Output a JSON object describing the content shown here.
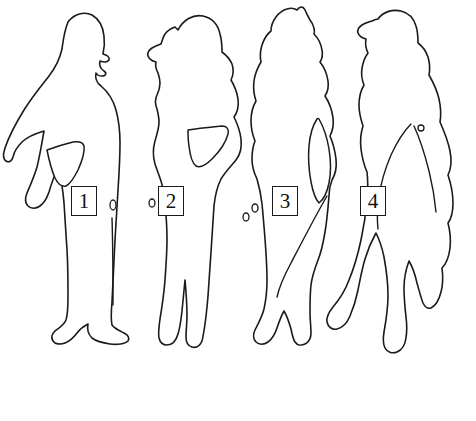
{
  "image": {
    "title": "Four human figure outlines",
    "width": 476,
    "height": 421,
    "background_color": "#ffffff",
    "stroke_color": "#1a1a1a",
    "style": "line-art outline drawing"
  },
  "figures": [
    {
      "id": "figure-1",
      "label": "1",
      "description": "Standing person in left profile with long hair, arm on hip forming a triangular gap, wearing long garment and shoes"
    },
    {
      "id": "figure-2",
      "label": "2",
      "description": "Standing person in right profile with long wavy hair, hand on hip forming a triangular gap, long trousers"
    },
    {
      "id": "figure-3",
      "label": "3",
      "description": "Standing person with tall pointed hair or head covering, arm away from body forming a narrow lens-shaped gap"
    },
    {
      "id": "figure-4",
      "label": "4",
      "description": "Walking person in right profile with long hair, legs apart mid-stride, arm hanging alongside body"
    }
  ],
  "labels": {
    "label_1": "1",
    "label_2": "2",
    "label_3": "3",
    "label_4": "4"
  }
}
